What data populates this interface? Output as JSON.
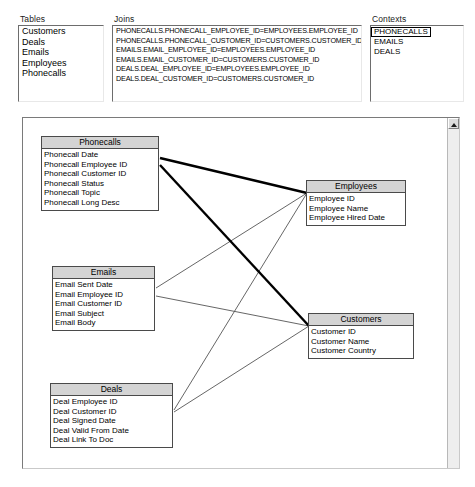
{
  "panes": {
    "tables": {
      "header": "Tables",
      "items": [
        "Customers",
        "Deals",
        "Emails",
        "Employees",
        "Phonecalls"
      ]
    },
    "joins": {
      "header": "Joins",
      "items": [
        "PHONECALLS.PHONECALL_EMPLOYEE_ID=EMPLOYEES.EMPLOYEE_ID",
        "PHONECALLS.PHONECALL_CUSTOMER_ID=CUSTOMERS.CUSTOMER_ID",
        "EMAILS.EMAIL_EMPLOYEE_ID=EMPLOYEES.EMPLOYEE_ID",
        "EMAILS.EMAIL_CUSTOMER_ID=CUSTOMERS.CUSTOMER_ID",
        "DEALS.DEAL_EMPLOYEE_ID=EMPLOYEES.EMPLOYEE_ID",
        "DEALS.DEAL_CUSTOMER_ID=CUSTOMERS.CUSTOMER_ID"
      ]
    },
    "contexts": {
      "header": "Contexts",
      "items": [
        "PHONECALLS",
        "EMAILS",
        "DEALS"
      ],
      "selected": "PHONECALLS"
    }
  },
  "diagram": {
    "entities": {
      "phonecalls": {
        "title": "Phonecalls",
        "fields": [
          "Phonecall  Date",
          "Phonecall  Employee ID",
          "Phonecall  Customer ID",
          "Phonecall  Status",
          "Phonecall  Topic",
          "Phonecall  Long Desc"
        ]
      },
      "employees": {
        "title": "Employees",
        "fields": [
          "Employee  ID",
          "Employee  Name",
          "Employee  Hired Date"
        ]
      },
      "emails": {
        "title": "Emails",
        "fields": [
          "Email  Sent  Date",
          "Email  Employee  ID",
          "Email  Customer  ID",
          "Email  Subject",
          "Email  Body"
        ]
      },
      "customers": {
        "title": "Customers",
        "fields": [
          "Customer  ID",
          "Customer  Name",
          "Customer  Country"
        ]
      },
      "deals": {
        "title": "Deals",
        "fields": [
          "Deal  Employee ID",
          "Deal  Customer ID",
          "Deal  Signed  Date",
          "Deal  Valid  From Date",
          "Deal  Link  To Doc"
        ]
      }
    },
    "links": [
      {
        "from": "phonecalls",
        "to": "employees",
        "highlighted": true
      },
      {
        "from": "phonecalls",
        "to": "customers",
        "highlighted": true
      },
      {
        "from": "emails",
        "to": "employees",
        "highlighted": false
      },
      {
        "from": "emails",
        "to": "customers",
        "highlighted": false
      },
      {
        "from": "deals",
        "to": "employees",
        "highlighted": false
      },
      {
        "from": "deals",
        "to": "customers",
        "highlighted": false
      }
    ]
  },
  "scrollbar": {
    "up_arrow_icon": "triangle-up-icon"
  },
  "colors": {
    "line_highlight": "#000000",
    "line_normal": "#4a4a4a",
    "entity_header": "#d4d4d4",
    "panel_face": "#ffffff"
  }
}
